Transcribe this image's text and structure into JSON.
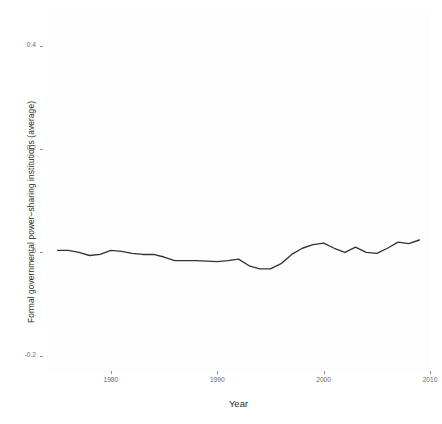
{
  "chart_data": {
    "type": "line",
    "title": "",
    "subtitle": "",
    "xlabel": "Year",
    "ylabel": "Formal governmental power–sharing institutions (average)",
    "xlim": [
      1974,
      2010
    ],
    "ylim": [
      -0.23,
      0.47
    ],
    "grid": false,
    "legend_position": "none",
    "x_ticks": [
      1980,
      1990,
      2000,
      2010
    ],
    "x_tick_labels": [
      "1980",
      "1990",
      "2000",
      "2010"
    ],
    "y_ticks": [
      0.4,
      0.2,
      0.0,
      -0.2
    ],
    "y_tick_labels": [
      "0.4",
      "0.2",
      "0",
      "-0.2"
    ],
    "line_color": "#333333",
    "panel_color": "#fdfdfd",
    "series": [
      {
        "name": "Formal governmental power-sharing institutions (average)",
        "x": [
          1975,
          1976,
          1977,
          1978,
          1979,
          1980,
          1981,
          1982,
          1983,
          1984,
          1985,
          1986,
          1987,
          1988,
          1989,
          1990,
          1991,
          1992,
          1993,
          1994,
          1995,
          1996,
          1997,
          1998,
          1999,
          2000,
          2001,
          2002,
          2003,
          2004,
          2005,
          2006,
          2007,
          2008,
          2009
        ],
        "y": [
          0.004,
          0.004,
          0.0,
          -0.006,
          -0.004,
          0.004,
          0.002,
          -0.002,
          -0.004,
          -0.004,
          -0.009,
          -0.016,
          -0.016,
          -0.016,
          -0.017,
          -0.018,
          -0.016,
          -0.013,
          -0.026,
          -0.032,
          -0.032,
          -0.022,
          -0.004,
          0.008,
          0.015,
          0.018,
          0.008,
          0.0,
          0.01,
          0.0,
          -0.002,
          0.008,
          0.02,
          0.017,
          0.024
        ]
      }
    ]
  },
  "axis": {
    "x_title": "Year",
    "y_title": "Formal governmental power–sharing institutions (average)"
  }
}
